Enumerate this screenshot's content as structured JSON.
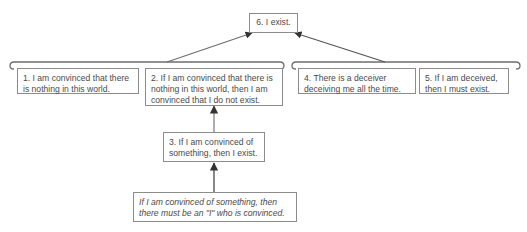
{
  "diagram": {
    "type": "argument-map",
    "nodes": [
      {
        "id": "6",
        "text": "6. I exist.",
        "role": "conclusion"
      },
      {
        "id": "1",
        "text": "1. I am convinced that there\nis nothing in this world.",
        "role": "premise"
      },
      {
        "id": "2",
        "text": "2. If I am convinced that there is\nnothing in this world, then I am\nconvinced that I do not exist.",
        "role": "premise"
      },
      {
        "id": "4",
        "text": "4. There is a deceiver\ndeceiving me all the time.",
        "role": "premise"
      },
      {
        "id": "5",
        "text": "5. If I am deceived,\nthen I must exist.",
        "role": "premise"
      },
      {
        "id": "3",
        "text": "3. If I am convinced of\nsomething, then I exist.",
        "role": "co-premise"
      },
      {
        "id": "support",
        "text": "If I am convinced of something, then\nthere must be an \"I\" who is convinced.",
        "role": "supporting-reason"
      }
    ],
    "groups": [
      {
        "id": "left-reason",
        "members": [
          "1",
          "2"
        ],
        "supports": "6"
      },
      {
        "id": "right-reason",
        "members": [
          "4",
          "5"
        ],
        "supports": "6"
      }
    ],
    "edges": [
      {
        "from": "left-reason",
        "to": "6"
      },
      {
        "from": "right-reason",
        "to": "6"
      },
      {
        "from": "3",
        "to": "2"
      },
      {
        "from": "support",
        "to": "3"
      }
    ],
    "colors": {
      "line": "#6e6e6e",
      "box_border": "#8c8c8c",
      "text": "#4a4a4a",
      "background": "#ffffff"
    }
  }
}
